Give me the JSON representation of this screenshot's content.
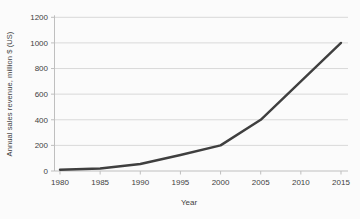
{
  "chart_data": {
    "type": "line",
    "title": "",
    "xlabel": "Year",
    "ylabel": "Annual sales revenue, million $ (US)",
    "x": [
      1980,
      1985,
      1990,
      1995,
      2000,
      2005,
      2010,
      2015
    ],
    "series": [
      {
        "name": "annual-sales-revenue",
        "values": [
          10,
          20,
          55,
          125,
          200,
          400,
          700,
          1000
        ]
      }
    ],
    "xlim": [
      1980,
      2015
    ],
    "ylim": [
      0,
      1200
    ],
    "x_ticks": [
      1980,
      1985,
      1990,
      1995,
      2000,
      2005,
      2010,
      2015
    ],
    "y_ticks": [
      0,
      200,
      400,
      600,
      800,
      1000,
      1200
    ],
    "grid": "horizontal",
    "legend": "none",
    "colors": {
      "line": "#3f3f3f",
      "grid": "#d9d9d9",
      "axis": "#bfbfbf",
      "text": "#3f3f3f",
      "background": "#fbfbfb"
    }
  }
}
